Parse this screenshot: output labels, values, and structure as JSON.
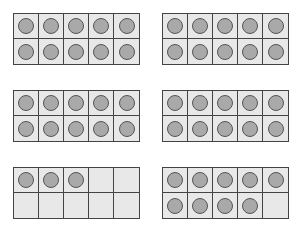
{
  "diagram": {
    "type": "ten-frames",
    "colors": {
      "frame_border": "#444444",
      "cell_fill": "#e8e8e8",
      "counter_fill": "#a9a9a9",
      "counter_border": "#555555"
    },
    "frames": [
      {
        "filled": 10,
        "x": 13,
        "y": 13
      },
      {
        "filled": 10,
        "x": 162,
        "y": 13
      },
      {
        "filled": 10,
        "x": 13,
        "y": 90
      },
      {
        "filled": 10,
        "x": 162,
        "y": 90
      },
      {
        "filled": 3,
        "x": 13,
        "y": 167
      },
      {
        "filled": 9,
        "x": 162,
        "y": 167
      }
    ],
    "total_counters": 52
  }
}
